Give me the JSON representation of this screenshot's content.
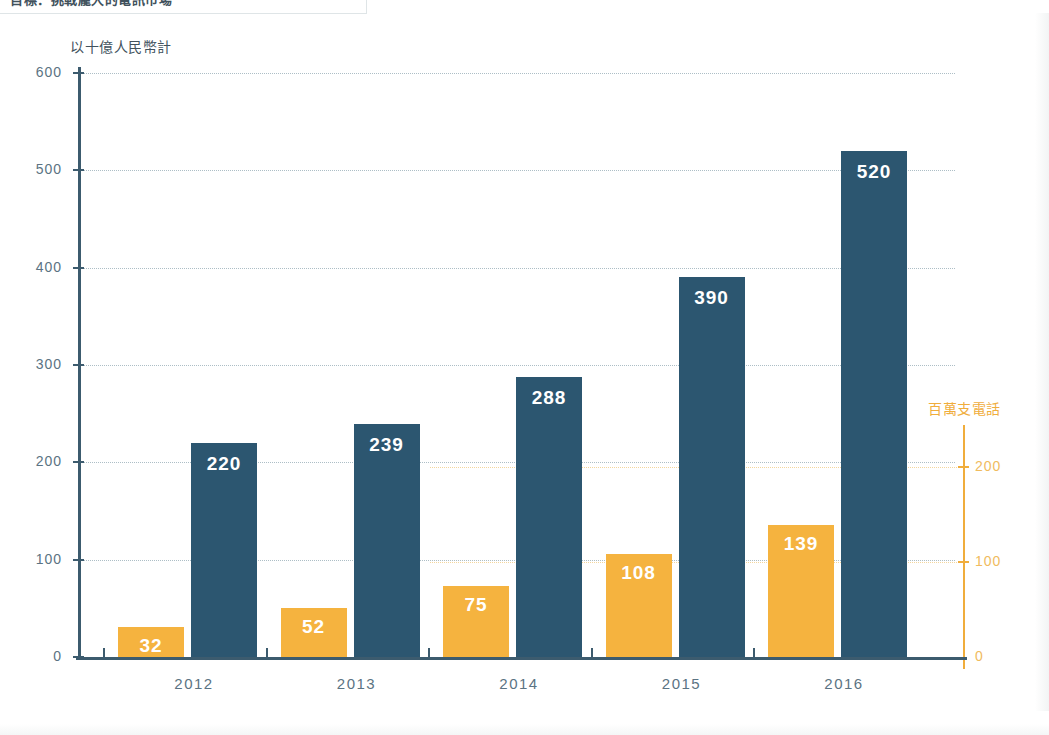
{
  "header": {
    "cropped_title": "目標：挑戰龐大的電訊市場"
  },
  "chart_data": {
    "type": "bar",
    "title": "",
    "categories": [
      "2012",
      "2013",
      "2014",
      "2015",
      "2016"
    ],
    "series": [
      {
        "name": "百萬支電話",
        "key": "phones",
        "axis": "right",
        "color": "#f5b33f",
        "values": [
          32,
          52,
          75,
          108,
          139
        ]
      },
      {
        "name": "以十億人民幣計",
        "key": "revenue",
        "axis": "left",
        "color": "#2c5670",
        "values": [
          220,
          239,
          288,
          390,
          520
        ]
      }
    ],
    "left_axis": {
      "label": "以十億人民幣計",
      "ticks": [
        0,
        100,
        200,
        300,
        400,
        500,
        600
      ],
      "ylim": [
        0,
        600
      ],
      "color": "#3c5b6e"
    },
    "right_axis": {
      "label": "百萬支電話",
      "ticks": [
        0,
        100,
        200
      ],
      "ylim": [
        0,
        212
      ],
      "color": "#f0ad3c"
    },
    "xlabel": "",
    "grid": true,
    "legend_position": "none"
  }
}
